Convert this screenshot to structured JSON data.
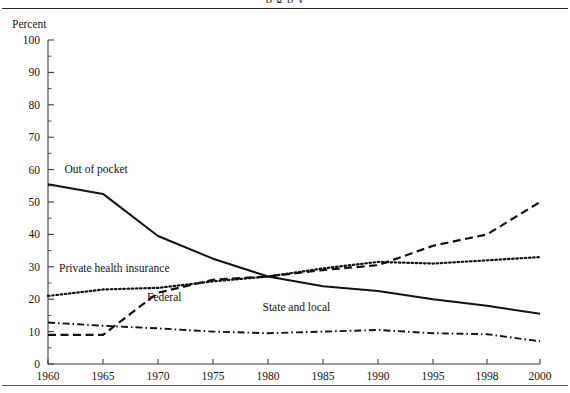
{
  "page": {
    "unit_label": "Percent",
    "clipped_title_fragment": "p g p y"
  },
  "chart_data": {
    "type": "line",
    "title": "",
    "xlabel": "",
    "ylabel": "Percent",
    "ylim": [
      0,
      100
    ],
    "xlim": [
      1960,
      2000
    ],
    "grid": false,
    "legend": "inline-labels",
    "y_ticks": [
      0,
      10,
      20,
      30,
      40,
      50,
      60,
      70,
      80,
      90,
      100
    ],
    "y_minor_ticks": [
      5,
      15,
      25,
      35,
      45,
      55,
      65,
      75,
      85,
      95
    ],
    "x_tick_labels": [
      "1960",
      "1965",
      "1970",
      "1975",
      "1980",
      "1985",
      "1990",
      "1995",
      "1998",
      "2000"
    ],
    "x_tick_values": [
      1960,
      1965,
      1970,
      1975,
      1980,
      1985,
      1990,
      1995,
      1998,
      2000
    ],
    "x": [
      1960,
      1965,
      1970,
      1975,
      1980,
      1985,
      1990,
      1995,
      1998,
      2000
    ],
    "series": [
      {
        "name": "Out of pocket",
        "style": "solid",
        "label_x": 1961.5,
        "label_y": 59,
        "values": [
          55.5,
          52.5,
          39.5,
          32.5,
          27.0,
          24.0,
          22.5,
          20.0,
          18.0,
          15.5
        ]
      },
      {
        "name": "Private health insurance",
        "style": "dotted",
        "label_x": 1961.0,
        "label_y": 28.5,
        "values": [
          21.0,
          23.0,
          23.5,
          25.5,
          27.0,
          29.5,
          31.5,
          31.0,
          32.0,
          33.0
        ]
      },
      {
        "name": "Federal",
        "style": "dashed",
        "label_x": 1969.0,
        "label_y": 19.5,
        "values": [
          9.0,
          9.0,
          22.0,
          26.0,
          27.0,
          29.0,
          30.5,
          36.5,
          40.0,
          50.0
        ]
      },
      {
        "name": "State and local",
        "style": "dashdot",
        "label_x": 1979.5,
        "label_y": 16.5,
        "values": [
          12.8,
          11.8,
          11.0,
          10.0,
          9.5,
          10.0,
          10.5,
          9.5,
          9.2,
          7.0
        ]
      }
    ]
  }
}
